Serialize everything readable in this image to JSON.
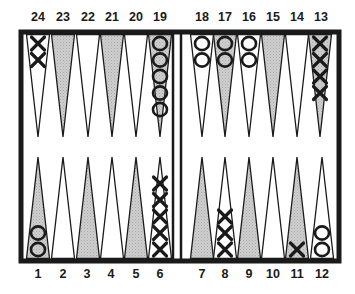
{
  "board": {
    "frame_color": "#1a1a1a",
    "shaded_color": "#c4c4c4",
    "light_color": "#ffffff",
    "top_row": [
      {
        "point": "24",
        "shaded": false,
        "checkers": {
          "type": "X",
          "count": 2
        }
      },
      {
        "point": "23",
        "shaded": true,
        "checkers": {
          "type": "",
          "count": 0
        }
      },
      {
        "point": "22",
        "shaded": false,
        "checkers": {
          "type": "",
          "count": 0
        }
      },
      {
        "point": "21",
        "shaded": true,
        "checkers": {
          "type": "",
          "count": 0
        }
      },
      {
        "point": "20",
        "shaded": false,
        "checkers": {
          "type": "",
          "count": 0
        }
      },
      {
        "point": "19",
        "shaded": true,
        "checkers": {
          "type": "O",
          "count": 5
        }
      },
      {
        "point": "18",
        "shaded": false,
        "checkers": {
          "type": "O",
          "count": 2
        }
      },
      {
        "point": "17",
        "shaded": true,
        "checkers": {
          "type": "O",
          "count": 2
        }
      },
      {
        "point": "16",
        "shaded": false,
        "checkers": {
          "type": "O",
          "count": 2
        }
      },
      {
        "point": "15",
        "shaded": true,
        "checkers": {
          "type": "",
          "count": 0
        }
      },
      {
        "point": "14",
        "shaded": false,
        "checkers": {
          "type": "",
          "count": 0
        }
      },
      {
        "point": "13",
        "shaded": true,
        "checkers": {
          "type": "X",
          "count": 4
        }
      }
    ],
    "bottom_row": [
      {
        "point": "1",
        "shaded": true,
        "checkers": {
          "type": "O",
          "count": 2
        }
      },
      {
        "point": "2",
        "shaded": false,
        "checkers": {
          "type": "",
          "count": 0
        }
      },
      {
        "point": "3",
        "shaded": true,
        "checkers": {
          "type": "",
          "count": 0
        }
      },
      {
        "point": "4",
        "shaded": false,
        "checkers": {
          "type": "",
          "count": 0
        }
      },
      {
        "point": "5",
        "shaded": true,
        "checkers": {
          "type": "",
          "count": 0
        }
      },
      {
        "point": "6",
        "shaded": false,
        "checkers": {
          "type": "X",
          "count": 5
        }
      },
      {
        "point": "7",
        "shaded": true,
        "checkers": {
          "type": "",
          "count": 0
        }
      },
      {
        "point": "8",
        "shaded": false,
        "checkers": {
          "type": "X",
          "count": 3
        }
      },
      {
        "point": "9",
        "shaded": true,
        "checkers": {
          "type": "",
          "count": 0
        }
      },
      {
        "point": "10",
        "shaded": false,
        "checkers": {
          "type": "",
          "count": 0
        }
      },
      {
        "point": "11",
        "shaded": true,
        "checkers": {
          "type": "X",
          "count": 1
        }
      },
      {
        "point": "12",
        "shaded": false,
        "checkers": {
          "type": "O",
          "count": 2
        }
      }
    ]
  }
}
